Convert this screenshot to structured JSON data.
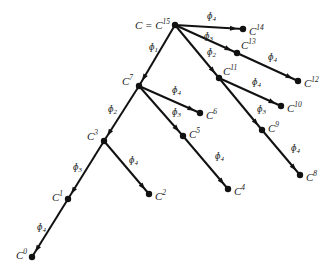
{
  "diagram": {
    "type": "binomial-tree",
    "root_label_prefix": "C = ",
    "nodes": [
      {
        "id": "C15",
        "base": "C",
        "sup": "15",
        "x": 175,
        "y": 25,
        "lx": -40,
        "ly": 0,
        "prefix": "C = "
      },
      {
        "id": "C14",
        "base": "C",
        "sup": "14",
        "x": 243,
        "y": 29,
        "lx": 6,
        "ly": 2
      },
      {
        "id": "C13",
        "base": "C",
        "sup": "13",
        "x": 237,
        "y": 53,
        "lx": 4,
        "ly": -8
      },
      {
        "id": "C12",
        "base": "C",
        "sup": "12",
        "x": 298,
        "y": 81,
        "lx": 6,
        "ly": 2
      },
      {
        "id": "C11",
        "base": "C",
        "sup": "11",
        "x": 219,
        "y": 78,
        "lx": 4,
        "ly": -7
      },
      {
        "id": "C10",
        "base": "C",
        "sup": "10",
        "x": 281,
        "y": 106,
        "lx": 6,
        "ly": 2
      },
      {
        "id": "C9",
        "base": "C",
        "sup": "9",
        "x": 262,
        "y": 130,
        "lx": 6,
        "ly": -2
      },
      {
        "id": "C8",
        "base": "C",
        "sup": "8",
        "x": 300,
        "y": 175,
        "lx": 6,
        "ly": 2
      },
      {
        "id": "C7",
        "base": "C",
        "sup": "7",
        "x": 139,
        "y": 86,
        "lx": -17,
        "ly": -5
      },
      {
        "id": "C6",
        "base": "C",
        "sup": "6",
        "x": 200,
        "y": 113,
        "lx": 6,
        "ly": 2
      },
      {
        "id": "C5",
        "base": "C",
        "sup": "5",
        "x": 183,
        "y": 136,
        "lx": 6,
        "ly": -2
      },
      {
        "id": "C4",
        "base": "C",
        "sup": "4",
        "x": 228,
        "y": 189,
        "lx": 6,
        "ly": 2
      },
      {
        "id": "C3",
        "base": "C",
        "sup": "3",
        "x": 104,
        "y": 141,
        "lx": -17,
        "ly": -5
      },
      {
        "id": "C2",
        "base": "C",
        "sup": "2",
        "x": 149,
        "y": 194,
        "lx": 6,
        "ly": 2
      },
      {
        "id": "C1",
        "base": "C",
        "sup": "1",
        "x": 68,
        "y": 199,
        "lx": -16,
        "ly": -2
      },
      {
        "id": "C0",
        "base": "C",
        "sup": "0",
        "x": 32,
        "y": 257,
        "lx": -16,
        "ly": -2
      }
    ],
    "edges": [
      {
        "from": "C15",
        "to": "C14",
        "label_sub": "4",
        "lx": 207,
        "ly": 19
      },
      {
        "from": "C15",
        "to": "C13",
        "label_sub": "3",
        "lx": 204,
        "ly": 39
      },
      {
        "from": "C13",
        "to": "C12",
        "label_sub": "4",
        "lx": 268,
        "ly": 60
      },
      {
        "from": "C15",
        "to": "C11",
        "label_sub": "2",
        "lx": 207,
        "ly": 55
      },
      {
        "from": "C11",
        "to": "C10",
        "label_sub": "4",
        "lx": 252,
        "ly": 85
      },
      {
        "from": "C11",
        "to": "C9",
        "label_sub": "3",
        "lx": 257,
        "ly": 112
      },
      {
        "from": "C9",
        "to": "C8",
        "label_sub": "4",
        "lx": 291,
        "ly": 151
      },
      {
        "from": "C15",
        "to": "C7",
        "label_sub": "1",
        "lx": 149,
        "ly": 50
      },
      {
        "from": "C7",
        "to": "C6",
        "label_sub": "4",
        "lx": 172,
        "ly": 93
      },
      {
        "from": "C7",
        "to": "C5",
        "label_sub": "3",
        "lx": 172,
        "ly": 115
      },
      {
        "from": "C5",
        "to": "C4",
        "label_sub": "4",
        "lx": 215,
        "ly": 159
      },
      {
        "from": "C7",
        "to": "C3",
        "label_sub": "2",
        "lx": 108,
        "ly": 112
      },
      {
        "from": "C3",
        "to": "C2",
        "label_sub": "4",
        "lx": 129,
        "ly": 163
      },
      {
        "from": "C3",
        "to": "C1",
        "label_sub": "3",
        "lx": 73,
        "ly": 170
      },
      {
        "from": "C1",
        "to": "C0",
        "label_sub": "4",
        "lx": 37,
        "ly": 230
      }
    ],
    "edge_symbol": "ɸ",
    "colors": {
      "stroke": "#111111",
      "text": "#222222",
      "background": "#ffffff"
    }
  }
}
